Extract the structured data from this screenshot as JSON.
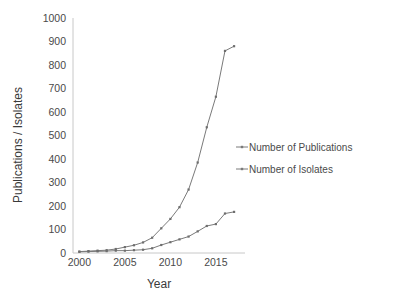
{
  "chart_data": {
    "type": "line",
    "title": "",
    "xlabel": "Year",
    "ylabel": "Publications / Isolates",
    "xlim": [
      1999.3,
      2018.2
    ],
    "ylim": [
      0,
      1000
    ],
    "xticks": [
      "2000",
      "2005",
      "2010",
      "2015"
    ],
    "xtick_values": [
      2000,
      2005,
      2010,
      2015
    ],
    "yticks": [
      "0",
      "100",
      "200",
      "300",
      "400",
      "500",
      "600",
      "700",
      "800",
      "900",
      "1000"
    ],
    "ytick_values": [
      0,
      100,
      200,
      300,
      400,
      500,
      600,
      700,
      800,
      900,
      1000
    ],
    "grid": false,
    "legend_position": "right",
    "x": [
      2000,
      2001,
      2002,
      2003,
      2004,
      2005,
      2006,
      2007,
      2008,
      2009,
      2010,
      2011,
      2012,
      2013,
      2014,
      2015,
      2016,
      2017
    ],
    "series": [
      {
        "name": "Number of Publications",
        "color": "#7a7a7a",
        "values": [
          6,
          8,
          10,
          12,
          17,
          25,
          33,
          45,
          65,
          105,
          145,
          195,
          270,
          385,
          535,
          665,
          860,
          880
        ]
      },
      {
        "name": "Number of Isolates",
        "color": "#7a7a7a",
        "values": [
          5,
          6,
          7,
          8,
          10,
          10,
          12,
          14,
          20,
          34,
          46,
          58,
          70,
          92,
          115,
          123,
          168,
          175
        ]
      }
    ]
  },
  "axes": {
    "x_title": "Year",
    "y_title": "Publications / Isolates"
  },
  "legend": {
    "entries": [
      {
        "label": "Number of Publications"
      },
      {
        "label": "Number of Isolates"
      }
    ]
  }
}
